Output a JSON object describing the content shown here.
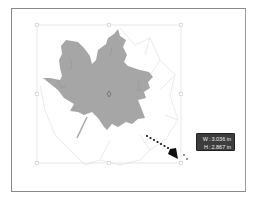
{
  "canvas": {
    "object": "maple-leaf",
    "fill_color": "#a6a6a6",
    "bounding_box_color": "#d8d8d8",
    "ghost_outline_color": "#e6e6e6"
  },
  "tooltip": {
    "width_label": "W",
    "width_value": "3.036 in",
    "height_label": "H",
    "height_value": "2.867 in",
    "separator": ":"
  },
  "annotation": {
    "type": "dotted-arrow",
    "color": "#111111"
  }
}
